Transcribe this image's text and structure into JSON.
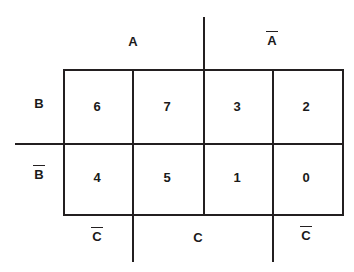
{
  "diagram": {
    "type": "karnaugh-map",
    "variables": [
      "A",
      "B",
      "C"
    ],
    "background_color": "#ffffff",
    "line_color": "#231f20",
    "text_color": "#1a1a1a"
  },
  "axis_labels": {
    "top_left": {
      "text": "A",
      "overbar": false
    },
    "top_right": {
      "text": "A",
      "overbar": true
    },
    "left_top": {
      "text": "B",
      "overbar": false
    },
    "left_bottom": {
      "text": "B",
      "overbar": true
    },
    "bottom_left": {
      "text": "C",
      "overbar": true
    },
    "bottom_center": {
      "text": "C",
      "overbar": false
    },
    "bottom_right": {
      "text": "C",
      "overbar": true
    }
  },
  "grid": {
    "columns": 4,
    "rows": 2,
    "row_labels": [
      "B",
      "B̄"
    ],
    "column_groups": [
      "A",
      "Ā"
    ],
    "cells": [
      {
        "row": 0,
        "col": 0,
        "value": "6"
      },
      {
        "row": 0,
        "col": 1,
        "value": "7"
      },
      {
        "row": 0,
        "col": 2,
        "value": "3"
      },
      {
        "row": 0,
        "col": 3,
        "value": "2"
      },
      {
        "row": 1,
        "col": 0,
        "value": "4"
      },
      {
        "row": 1,
        "col": 1,
        "value": "5"
      },
      {
        "row": 1,
        "col": 2,
        "value": "1"
      },
      {
        "row": 1,
        "col": 3,
        "value": "0"
      }
    ]
  }
}
